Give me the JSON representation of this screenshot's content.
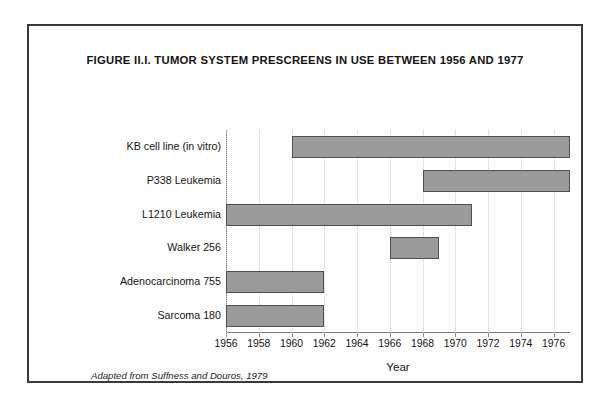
{
  "figure": {
    "title": "FIGURE II.I.  TUMOR SYSTEM PRESCREENS IN USE BETWEEN 1956 AND 1977",
    "source_note": "Adapted from Suffness and Douros, 1979",
    "frame_color": "#3a3a3a"
  },
  "chart_data": {
    "type": "bar",
    "orientation": "horizontal",
    "title": "FIGURE II.I.  TUMOR SYSTEM PRESCREENS IN USE BETWEEN 1956 AND 1977",
    "xlabel": "Year",
    "ylabel": "",
    "xlim": [
      1956,
      1977
    ],
    "xticks": [
      1956,
      1958,
      1960,
      1962,
      1964,
      1966,
      1968,
      1970,
      1972,
      1974,
      1976
    ],
    "xtick_labels": [
      "1956",
      "1958",
      "1960",
      "1962",
      "1964",
      "1966",
      "1968",
      "1970",
      "1972",
      "1974",
      "1976"
    ],
    "grid": true,
    "grid_axis": "x",
    "legend": false,
    "bar_color": "#9b9b9b",
    "bar_edge_color": "#4f4f4f",
    "categories": [
      "KB cell line (in vitro)",
      "P338 Leukemia",
      "L1210 Leukemia",
      "Walker 256",
      "Adenocarcinoma 755",
      "Sarcoma 180"
    ],
    "bars": [
      {
        "label": "KB cell line (in vitro)",
        "start": 1960,
        "end": 1977,
        "duration": 17
      },
      {
        "label": "P338 Leukemia",
        "start": 1968,
        "end": 1977,
        "duration": 9
      },
      {
        "label": "L1210 Leukemia",
        "start": 1956,
        "end": 1971,
        "duration": 15
      },
      {
        "label": "Walker 256",
        "start": 1966,
        "end": 1969,
        "duration": 3
      },
      {
        "label": "Adenocarcinoma 755",
        "start": 1956,
        "end": 1962,
        "duration": 6
      },
      {
        "label": "Sarcoma 180",
        "start": 1956,
        "end": 1962,
        "duration": 6
      }
    ]
  }
}
